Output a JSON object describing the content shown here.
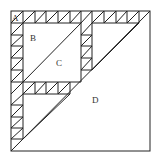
{
  "diagram": {
    "labels": {
      "a": "A",
      "b": "B",
      "c": "C",
      "d": "D"
    },
    "colors": {
      "stroke": "#222222",
      "background": "#ffffff",
      "label": "#333333"
    }
  }
}
